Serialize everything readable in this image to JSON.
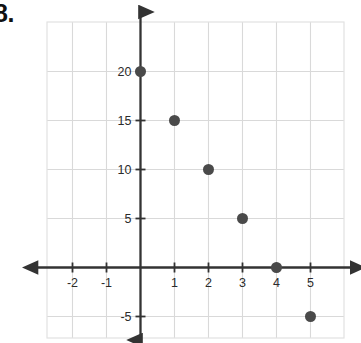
{
  "problem": {
    "number_label": "8."
  },
  "chart_data": {
    "type": "scatter",
    "title": "",
    "subtitle": "",
    "xlabel": "",
    "ylabel": "",
    "x": [
      0,
      1,
      2,
      3,
      4,
      5
    ],
    "values": [
      20,
      15,
      10,
      5,
      0,
      -5
    ],
    "points": [
      {
        "x": 0,
        "y": 20
      },
      {
        "x": 1,
        "y": 15
      },
      {
        "x": 2,
        "y": 10
      },
      {
        "x": 3,
        "y": 5
      },
      {
        "x": 4,
        "y": 0
      },
      {
        "x": 5,
        "y": -5
      }
    ],
    "xlim": [
      -2.4,
      5.5
    ],
    "ylim": [
      -6.2,
      21.5
    ],
    "x_ticks": [
      -2,
      -1,
      1,
      2,
      3,
      4,
      5
    ],
    "x_tick_labels": [
      "-2",
      "-1",
      "1",
      "2",
      "3",
      "4",
      "5"
    ],
    "y_ticks": [
      -5,
      5,
      10,
      15,
      20
    ],
    "y_tick_labels": [
      "-5",
      "5",
      "10",
      "15",
      "20"
    ],
    "grid": true,
    "grid_x": [
      -2,
      -1,
      0,
      1,
      2,
      3,
      4,
      5
    ],
    "grid_y": [
      -5,
      0,
      5,
      10,
      15,
      20
    ],
    "legend": null,
    "legend_position": "none",
    "annotations": [],
    "marker": "circle",
    "marker_color": "#4a4a4a",
    "marker_size": 11,
    "axis_color": "#333333",
    "grid_color": "#d9d9d9",
    "background_color": "#ffffff"
  }
}
